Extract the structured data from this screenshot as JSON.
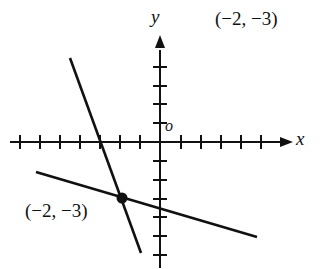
{
  "title_point": "(−2, −3)",
  "axes": {
    "x_label": "x",
    "y_label": "y",
    "origin_label": "o"
  },
  "intersection": {
    "label": "(−2, −3)",
    "x": -2,
    "y": -3
  },
  "lines": [
    {
      "name": "steep-line",
      "from": [
        -4.5,
        4.5
      ],
      "to": [
        -1,
        -6.5
      ]
    },
    {
      "name": "shallow-line",
      "from": [
        -6.2,
        -1.5
      ],
      "to": [
        5,
        -5
      ]
    }
  ],
  "colors": {
    "ink": "#111111",
    "background": "#ffffff"
  }
}
